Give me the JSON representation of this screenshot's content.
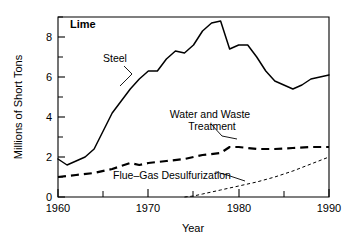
{
  "chart_data": {
    "type": "line",
    "title": "Lime",
    "xlabel": "Year",
    "ylabel": "Millions of Short Tons",
    "xlim": [
      1960,
      1990
    ],
    "ylim": [
      0,
      9
    ],
    "grid": false,
    "legend_position": "inline-annotations",
    "x_ticks_major": [
      1960,
      1970,
      1980,
      1990
    ],
    "x_ticks_minor": [
      1965,
      1975,
      1985
    ],
    "x_tick_labels": [
      "1960",
      "1970",
      "1980",
      "1990"
    ],
    "y_ticks_major": [
      0,
      2,
      4,
      6,
      8
    ],
    "y_ticks_minor": [
      1,
      3,
      5,
      7
    ],
    "y_tick_labels": [
      "0",
      "2",
      "4",
      "6",
      "8"
    ],
    "series": [
      {
        "name": "Steel",
        "style": "solid",
        "x": [
          1960,
          1961,
          1962,
          1963,
          1964,
          1965,
          1966,
          1967,
          1968,
          1969,
          1970,
          1971,
          1972,
          1973,
          1974,
          1975,
          1976,
          1977,
          1978,
          1979,
          1980,
          1981,
          1982,
          1983,
          1984,
          1985,
          1986,
          1987,
          1988,
          1989,
          1990
        ],
        "values": [
          1.9,
          1.6,
          1.8,
          2.0,
          2.4,
          3.3,
          4.2,
          4.8,
          5.4,
          5.9,
          6.3,
          6.3,
          6.9,
          7.3,
          7.2,
          7.6,
          8.3,
          8.7,
          8.8,
          7.4,
          7.6,
          7.6,
          7.0,
          6.3,
          5.8,
          5.6,
          5.4,
          5.6,
          5.9,
          6.0,
          6.1
        ]
      },
      {
        "name": "Water and Waste Treatment",
        "style": "dashed",
        "x": [
          1960,
          1962,
          1964,
          1966,
          1968,
          1969,
          1970,
          1972,
          1974,
          1976,
          1978,
          1979,
          1980,
          1982,
          1984,
          1986,
          1988,
          1990
        ],
        "values": [
          1.0,
          1.1,
          1.2,
          1.4,
          1.7,
          1.6,
          1.7,
          1.8,
          1.9,
          2.1,
          2.2,
          2.5,
          2.5,
          2.4,
          2.4,
          2.45,
          2.5,
          2.5
        ]
      },
      {
        "name": "Flue-Gas Desulfurization",
        "style": "dotted",
        "x": [
          1974,
          1975,
          1976,
          1978,
          1980,
          1982,
          1984,
          1986,
          1988,
          1990
        ],
        "values": [
          0.0,
          0.05,
          0.15,
          0.35,
          0.55,
          0.75,
          1.0,
          1.3,
          1.65,
          2.0
        ]
      }
    ],
    "annotations": [
      {
        "text": "Steel",
        "x": 1967,
        "y": 6.6
      },
      {
        "text": "Water and Waste",
        "x": 1977,
        "y": 4.0
      },
      {
        "text": "Treatment",
        "x": 1977.5,
        "y": 3.55
      },
      {
        "text": "Flue–Gas Desulfurization",
        "x": 1970,
        "y": 1.0
      }
    ],
    "colors": {
      "axis": "#000000",
      "steel": "#000000",
      "water": "#000000",
      "fgd": "#000000",
      "background": "#ffffff"
    }
  },
  "labels": {
    "title": "Lime",
    "ylabel": "Millions of Short Tons",
    "xlabel": "Year",
    "annot_steel": "Steel",
    "annot_water_line1": "Water and Waste",
    "annot_water_line2": "Treatment",
    "annot_fgd": "Flue–Gas Desulfurization",
    "x0": "1960",
    "x1": "1970",
    "x2": "1980",
    "x3": "1990",
    "y0": "0",
    "y2": "2",
    "y4": "4",
    "y6": "6",
    "y8": "8"
  }
}
